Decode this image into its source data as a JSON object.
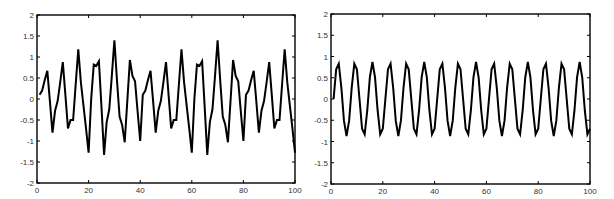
{
  "chart_data": [
    {
      "type": "line",
      "title": "",
      "xlabel": "",
      "ylabel": "",
      "xlim": [
        0,
        100
      ],
      "ylim": [
        -2,
        2
      ],
      "xticks": [
        0,
        20,
        40,
        60,
        80,
        100
      ],
      "yticks": [
        -2,
        -1.5,
        -1,
        -0.5,
        0,
        0.5,
        1,
        1.5,
        2
      ],
      "xtick_labels": [
        "0",
        "20",
        "40",
        "60",
        "80",
        "100"
      ],
      "ytick_labels": [
        "-2",
        "-1.5",
        "-1",
        "-0.5",
        "0",
        "0.5",
        "1",
        "1.5",
        "2"
      ],
      "grid": false,
      "legend": null,
      "series": [
        {
          "name": "signal",
          "color": "#000000",
          "x_start": 1,
          "x_step": 1,
          "values": [
            0.1,
            0.2,
            0.45,
            0.67,
            -0.05,
            -0.8,
            -0.28,
            -0.05,
            0.4,
            0.88,
            0.1,
            -0.7,
            -0.5,
            -0.5,
            0.35,
            1.18,
            0.4,
            -0.15,
            -0.7,
            -1.28,
            0.0,
            0.82,
            0.79,
            0.9,
            -0.2,
            -1.33,
            -0.55,
            -0.25,
            0.55,
            1.4,
            0.45,
            -0.42,
            -0.62,
            -1.03,
            -0.05,
            0.93,
            0.55,
            0.42,
            -0.3,
            -1.0,
            0.1,
            0.2,
            0.45,
            0.67,
            -0.05,
            -0.8,
            -0.28,
            -0.05,
            0.4,
            0.88,
            0.1,
            -0.7,
            -0.5,
            -0.5,
            0.35,
            1.18,
            0.4,
            -0.15,
            -0.7,
            -1.28,
            0.0,
            0.82,
            0.79,
            0.9,
            -0.2,
            -1.33,
            -0.55,
            -0.25,
            0.55,
            1.4,
            0.45,
            -0.42,
            -0.62,
            -1.03,
            -0.05,
            0.93,
            0.55,
            0.42,
            -0.3,
            -1.0,
            0.1,
            0.2,
            0.45,
            0.67,
            -0.05,
            -0.8,
            -0.28,
            -0.05,
            0.4,
            0.88,
            0.1,
            -0.7,
            -0.5,
            -0.5,
            0.35,
            1.18,
            0.4,
            -0.15,
            -0.7,
            -1.28
          ]
        }
      ]
    },
    {
      "type": "line",
      "title": "",
      "xlabel": "",
      "ylabel": "",
      "xlim": [
        0,
        100
      ],
      "ylim": [
        -2,
        2
      ],
      "xticks": [
        0,
        20,
        40,
        60,
        80,
        100
      ],
      "yticks": [
        -2,
        -1.5,
        -1,
        -0.5,
        0,
        0.5,
        1,
        1.5,
        2
      ],
      "xtick_labels": [
        "0",
        "20",
        "40",
        "60",
        "80",
        "100"
      ],
      "ytick_labels": [
        "-2",
        "-1.5",
        "-1",
        "-0.5",
        "0",
        "0.5",
        "1",
        "1.5",
        "2"
      ],
      "grid": false,
      "legend": null,
      "series": [
        {
          "name": "sinusoid",
          "color": "#000000",
          "x_start": 1,
          "x_step": 1,
          "values": [
            0,
            0.7,
            0.83,
            0.27,
            -0.51,
            -0.87,
            -0.51,
            0.27,
            0.83,
            0.7,
            0,
            -0.7,
            -0.83,
            -0.27,
            0.51,
            0.87,
            0.51,
            -0.27,
            -0.83,
            -0.7,
            0,
            0.7,
            0.83,
            0.27,
            -0.51,
            -0.87,
            -0.51,
            0.27,
            0.83,
            0.7,
            0,
            -0.7,
            -0.83,
            -0.27,
            0.51,
            0.87,
            0.51,
            -0.27,
            -0.83,
            -0.7,
            0,
            0.7,
            0.83,
            0.27,
            -0.51,
            -0.87,
            -0.51,
            0.27,
            0.83,
            0.7,
            0,
            -0.7,
            -0.83,
            -0.27,
            0.51,
            0.87,
            0.51,
            -0.27,
            -0.83,
            -0.7,
            0,
            0.7,
            0.83,
            0.27,
            -0.51,
            -0.87,
            -0.51,
            0.27,
            0.83,
            0.7,
            0,
            -0.7,
            -0.83,
            -0.27,
            0.51,
            0.87,
            0.51,
            -0.27,
            -0.83,
            -0.7,
            0,
            0.7,
            0.83,
            0.27,
            -0.51,
            -0.87,
            -0.51,
            0.27,
            0.83,
            0.7,
            0,
            -0.7,
            -0.83,
            -0.27,
            0.51,
            0.87,
            0.51,
            -0.27,
            -0.83,
            -0.7
          ]
        }
      ]
    }
  ],
  "layout": {
    "plots": [
      {
        "left": 37,
        "top": 15,
        "right": 295,
        "bottom": 183
      },
      {
        "left": 331,
        "top": 14,
        "right": 590,
        "bottom": 184
      }
    ]
  }
}
